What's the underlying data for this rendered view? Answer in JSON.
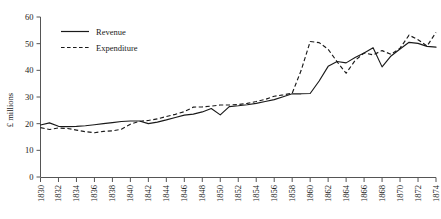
{
  "chart_data": {
    "type": "line",
    "title": "",
    "xlabel": "",
    "ylabel": "£ millions",
    "xlim": [
      1830,
      1874
    ],
    "ylim": [
      0,
      60
    ],
    "grid": false,
    "legend_position": "top-left",
    "x": [
      1830,
      1831,
      1832,
      1833,
      1834,
      1835,
      1836,
      1837,
      1838,
      1839,
      1840,
      1841,
      1842,
      1843,
      1844,
      1845,
      1846,
      1847,
      1848,
      1849,
      1850,
      1851,
      1852,
      1853,
      1854,
      1855,
      1856,
      1857,
      1858,
      1859,
      1860,
      1861,
      1862,
      1863,
      1864,
      1865,
      1866,
      1867,
      1868,
      1869,
      1870,
      1871,
      1872,
      1873,
      1874
    ],
    "xtick_labels": [
      "1830",
      "1832",
      "1834",
      "1836",
      "1838",
      "1840",
      "1842",
      "1844",
      "1846",
      "1848",
      "1850",
      "1852",
      "1854",
      "1856",
      "1858",
      "1860",
      "1862",
      "1864",
      "1866",
      "1868",
      "1870",
      "1872",
      "1874"
    ],
    "ytick_labels": [
      "0",
      "10",
      "20",
      "30",
      "40",
      "50",
      "60"
    ],
    "ytick_values": [
      0,
      10,
      20,
      30,
      40,
      50,
      60
    ],
    "series": [
      {
        "name": "Revenue",
        "style": "solid",
        "color": "#1a1a1a",
        "values": [
          19.5,
          20.3,
          19.0,
          18.9,
          19.0,
          19.2,
          19.6,
          20.0,
          20.4,
          20.8,
          21.0,
          21.0,
          20.0,
          20.6,
          21.4,
          22.3,
          23.2,
          23.6,
          24.4,
          25.7,
          23.3,
          26.4,
          26.7,
          27.1,
          27.6,
          28.3,
          29.0,
          30.1,
          31.2,
          31.2,
          31.3,
          36.0,
          41.5,
          43.3,
          42.8,
          44.8,
          46.5,
          48.5,
          41.3,
          45.4,
          48.0,
          50.5,
          50.1,
          49.0,
          48.7
        ]
      },
      {
        "name": "Expenditure",
        "style": "dashed",
        "color": "#1a1a1a",
        "values": [
          18.5,
          17.8,
          18.4,
          18.2,
          17.6,
          17.0,
          16.6,
          17.1,
          17.3,
          17.9,
          19.8,
          20.9,
          21.2,
          21.8,
          22.7,
          23.5,
          24.5,
          26.2,
          26.3,
          26.6,
          27.0,
          27.0,
          27.2,
          27.6,
          28.3,
          29.1,
          30.3,
          30.8,
          31.4,
          40.0,
          50.8,
          50.4,
          47.9,
          43.2,
          38.9,
          43.7,
          46.5,
          45.8,
          47.4,
          46.0,
          48.3,
          53.2,
          51.5,
          49.1,
          54.2
        ]
      }
    ]
  },
  "legend": {
    "items": [
      {
        "label": "Revenue"
      },
      {
        "label": "Expenditure"
      }
    ]
  },
  "axes": {
    "y_title": "£ millions"
  }
}
